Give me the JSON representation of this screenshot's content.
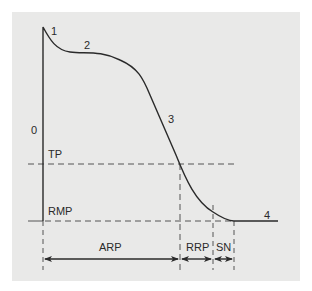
{
  "diagram": {
    "type": "cardiac-action-potential",
    "phase_labels": [
      "0",
      "1",
      "2",
      "3",
      "4"
    ],
    "threshold_label": "TP",
    "resting_label": "RMP",
    "intervals": [
      {
        "label": "ARP"
      },
      {
        "label": "RRP"
      },
      {
        "label": "SN"
      }
    ]
  },
  "colors": {
    "background": "#ffffff",
    "panel": "#e9e9e8",
    "line": "#2a2a2a",
    "dash": "#555555"
  }
}
